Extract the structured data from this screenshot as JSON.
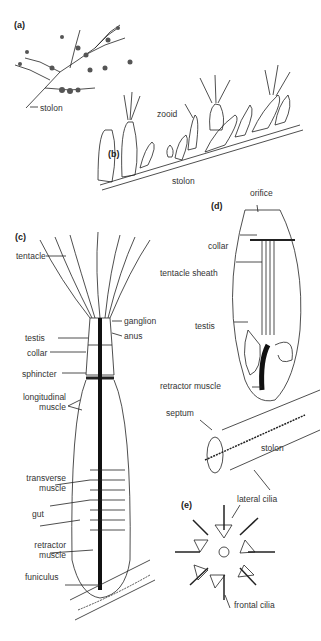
{
  "figure": {
    "panels": [
      {
        "id": "a",
        "label": "(a)",
        "annotations": [
          "stolon"
        ]
      },
      {
        "id": "b",
        "label": "(b)",
        "annotations": [
          "zooid",
          "stolon"
        ]
      },
      {
        "id": "c",
        "label": "(c)",
        "annotations": [
          "tentacle",
          "ganglion",
          "testis",
          "anus",
          "collar",
          "sphincter",
          "longitudinal muscle",
          "transverse muscle",
          "gut",
          "retractor muscle",
          "funiculus"
        ]
      },
      {
        "id": "d",
        "label": "(d)",
        "annotations": [
          "orifice",
          "collar",
          "tentacle sheath",
          "testis",
          "retractor muscle",
          "septum",
          "stolon"
        ]
      },
      {
        "id": "e",
        "label": "(e)",
        "annotations": [
          "lateral cilia",
          "frontal cilia"
        ]
      }
    ]
  },
  "labels": {
    "a_panel": "(a)",
    "a_stolon": "stolon",
    "b_panel": "(b)",
    "b_zooid": "zooid",
    "b_stolon": "stolon",
    "c_panel": "(c)",
    "c_tentacle": "tentacle",
    "c_ganglion": "ganglion",
    "c_testis": "testis",
    "c_anus": "anus",
    "c_collar": "collar",
    "c_sphincter": "sphincter",
    "c_longitudinal_1": "longitudinal",
    "c_longitudinal_2": "muscle",
    "c_transverse_1": "transverse",
    "c_transverse_2": "muscle",
    "c_gut": "gut",
    "c_retractor_1": "retractor",
    "c_retractor_2": "muscle",
    "c_funiculus": "funiculus",
    "d_panel": "(d)",
    "d_orifice": "orifice",
    "d_collar": "collar",
    "d_sheath": "tentacle sheath",
    "d_testis": "testis",
    "d_retractor": "retractor muscle",
    "d_septum": "septum",
    "d_stolon": "stolon",
    "e_panel": "(e)",
    "e_lateral": "lateral cilia",
    "e_frontal": "frontal cilia"
  }
}
